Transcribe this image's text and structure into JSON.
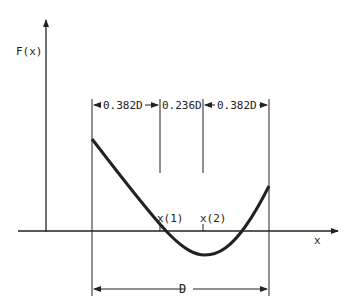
{
  "diagram": {
    "y_axis_label": "F(x)",
    "x_axis_label": "x",
    "segments": [
      {
        "label": "0.382D"
      },
      {
        "label": "0.236D"
      },
      {
        "label": "0.382D"
      }
    ],
    "points": [
      {
        "label": "x(1)"
      },
      {
        "label": "x(2)"
      }
    ],
    "interval_label": "D",
    "line_color": "#222222"
  }
}
